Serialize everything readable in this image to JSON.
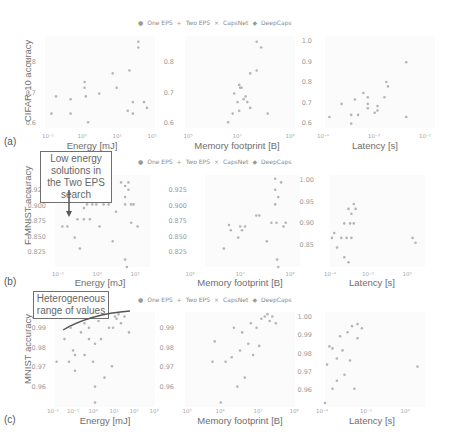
{
  "legend": {
    "entries": [
      {
        "marker": "●",
        "label": "One EPS"
      },
      {
        "marker": "+",
        "label": "Two EPS"
      },
      {
        "marker": "×",
        "label": "CapsNet"
      },
      {
        "marker": "◆",
        "label": "DeepCaps"
      }
    ]
  },
  "rows": [
    {
      "tag": "(a)",
      "ylabel": "CIFAR-10 accuracy",
      "panels": [
        {
          "xlabel": "Energy [mJ]",
          "xticks": [
            "10⁻¹",
            "10⁰",
            "10¹",
            "10²"
          ],
          "yticks": [
            "0.8",
            "0.7",
            "0.6"
          ]
        },
        {
          "xlabel": "Memory footprint [B]",
          "xticks": [
            "10⁵",
            "10⁷",
            "10⁸"
          ],
          "yticks": [
            "0.8",
            "0.7",
            "0.6"
          ]
        },
        {
          "xlabel": "Latency [s]",
          "xticks": [
            "10⁻⁴",
            "10⁻³",
            "10⁻²"
          ],
          "yticks": [
            "1.0",
            "0.9",
            "0.8",
            "0.7",
            "0.6"
          ]
        }
      ]
    },
    {
      "tag": "(b)",
      "ylabel": "F-MNIST accuracy",
      "annotation": "Low energy solutions in the Two EPS search",
      "panels": [
        {
          "xlabel": "Energy [mJ]",
          "xticks": [
            "10⁻¹",
            "10⁰",
            "10¹"
          ],
          "yticks": [
            "0.925",
            "0.900",
            "0.875",
            "0.850",
            "0.825"
          ]
        },
        {
          "xlabel": "Memory footprint [B]",
          "xticks": [
            "10⁶",
            "10⁷",
            "10⁸"
          ],
          "yticks": [
            "0.925",
            "0.900",
            "0.875",
            "0.850",
            "0.825"
          ]
        },
        {
          "xlabel": "Latency [s]",
          "xticks": [
            "10⁻⁴",
            "10⁻²",
            "10⁰"
          ],
          "yticks": [
            "1.00",
            "0.95",
            "0.90",
            "0.85"
          ]
        }
      ]
    },
    {
      "tag": "(c)",
      "ylabel": "MNIST accuracy",
      "annotation": "Heterogeneous range of values",
      "panels": [
        {
          "xlabel": "Energy [mJ]",
          "xticks": [
            "10⁻²",
            "10⁻¹",
            "10⁰",
            "10¹",
            "10²",
            "10³"
          ],
          "yticks": [
            "0.99",
            "0.98",
            "0.97",
            "0.96"
          ]
        },
        {
          "xlabel": "Memory footprint [B]",
          "xticks": [
            "10⁵",
            "10⁶",
            "10⁷",
            "10⁸"
          ],
          "yticks": [
            "0.99",
            "0.98",
            "0.97",
            "0.96"
          ]
        },
        {
          "xlabel": "Latency [s]",
          "xticks": [
            "10⁻⁴",
            "10⁻¹",
            "10⁰"
          ],
          "yticks": [
            "1.00",
            "0.99",
            "0.98",
            "0.97",
            "0.96"
          ]
        }
      ]
    }
  ],
  "chart_data": [
    {
      "type": "scatter",
      "title": "(a) CIFAR-10 accuracy vs Energy",
      "xlabel": "Energy [mJ]",
      "ylabel": "CIFAR-10 accuracy",
      "xscale": "log",
      "xlim": [
        0.1,
        100
      ],
      "ylim": [
        0.58,
        0.9
      ],
      "series": [
        {
          "name": "One EPS/Two EPS/CapsNet/DeepCaps (combined)",
          "x": [
            0.15,
            0.2,
            0.5,
            0.5,
            1.2,
            1.2,
            1.3,
            1.5,
            3,
            7,
            9,
            18,
            20,
            25,
            25,
            35,
            35,
            50,
            60
          ],
          "y": [
            0.63,
            0.69,
            0.63,
            0.68,
            0.72,
            0.74,
            0.69,
            0.6,
            0.7,
            0.77,
            0.72,
            0.64,
            0.78,
            0.63,
            0.67,
            0.88,
            0.86,
            0.67,
            0.65
          ]
        }
      ]
    },
    {
      "type": "scatter",
      "title": "(a) CIFAR-10 accuracy vs Memory",
      "xlabel": "Memory footprint [B]",
      "ylabel": "CIFAR-10 accuracy",
      "xscale": "log",
      "xlim": [
        100000,
        100000000
      ],
      "ylim": [
        0.58,
        0.9
      ],
      "series": [
        {
          "name": "combined",
          "x": [
            1500000.0,
            2000000.0,
            2200000.0,
            2700000.0,
            3000000.0,
            3000000.0,
            3200000.0,
            3500000.0,
            4000000.0,
            4500000.0,
            5000000.0,
            6000000.0,
            6000000.0,
            9000000.0,
            9000000.0,
            12000000.0,
            18000000.0
          ],
          "y": [
            0.6,
            0.63,
            0.7,
            0.67,
            0.73,
            0.64,
            0.72,
            0.72,
            0.68,
            0.69,
            0.67,
            0.77,
            0.65,
            0.88,
            0.78,
            0.86,
            0.63
          ]
        }
      ]
    },
    {
      "type": "scatter",
      "title": "(a) CIFAR-10 accuracy vs Latency",
      "xlabel": "Latency [s]",
      "ylabel": "CIFAR-10 accuracy",
      "xscale": "log",
      "xlim": [
        0.0001,
        0.01
      ],
      "ylim": [
        0.58,
        1.0
      ],
      "series": [
        {
          "name": "combined",
          "x": [
            0.00012,
            0.0002,
            0.0003,
            0.0003,
            0.00035,
            0.0004,
            0.0005,
            0.0006,
            0.0006,
            0.0006,
            0.0008,
            0.0009,
            0.0009,
            0.0012,
            0.0013,
            0.0014,
            0.003,
            0.003
          ],
          "y": [
            0.63,
            0.69,
            0.6,
            0.64,
            0.71,
            0.64,
            0.74,
            0.72,
            0.69,
            0.67,
            0.65,
            0.68,
            0.66,
            0.72,
            0.79,
            0.77,
            0.88,
            0.63
          ]
        }
      ]
    },
    {
      "type": "scatter",
      "title": "(b) F-MNIST accuracy vs Energy",
      "xlabel": "Energy [mJ]",
      "ylabel": "F-MNIST accuracy",
      "xscale": "log",
      "xlim": [
        0.1,
        20
      ],
      "ylim": [
        0.815,
        0.94
      ],
      "series": [
        {
          "name": "combined",
          "x": [
            0.15,
            0.2,
            0.3,
            0.35,
            0.4,
            0.5,
            0.5,
            0.6,
            0.7,
            0.8,
            1,
            1.2,
            1.5,
            2,
            2.5,
            3,
            4,
            5,
            5,
            5,
            5,
            5.5,
            6,
            6,
            7,
            7,
            8,
            10
          ],
          "y": [
            0.87,
            0.87,
            0.855,
            0.88,
            0.84,
            0.88,
            0.895,
            0.9,
            0.88,
            0.9,
            0.9,
            0.87,
            0.9,
            0.9,
            0.85,
            0.89,
            0.93,
            0.925,
            0.91,
            0.9,
            0.825,
            0.815,
            0.93,
            0.92,
            0.875,
            0.9,
            0.9,
            0.87
          ]
        }
      ]
    },
    {
      "type": "scatter",
      "title": "(b) F-MNIST accuracy vs Memory",
      "xlabel": "Memory footprint [B]",
      "ylabel": "F-MNIST accuracy",
      "xscale": "log",
      "xlim": [
        1000000,
        100000000
      ],
      "ylim": [
        0.815,
        0.94
      ],
      "series": [
        {
          "name": "combined",
          "x": [
            2500000.0,
            3200000.0,
            3500000.0,
            5000000.0,
            5500000.0,
            6000000.0,
            7000000.0,
            12000000.0,
            14000000.0,
            20000000.0,
            25000000.0,
            30000000.0,
            30000000.0,
            30000000.0,
            32000000.0,
            33000000.0,
            35000000.0,
            35000000.0,
            40000000.0,
            45000000.0,
            50000000.0
          ],
          "y": [
            0.84,
            0.872,
            0.865,
            0.855,
            0.87,
            0.865,
            0.87,
            0.885,
            0.885,
            0.85,
            0.875,
            0.935,
            0.92,
            0.9,
            0.875,
            0.825,
            0.91,
            0.815,
            0.93,
            0.87,
            0.875
          ]
        }
      ]
    },
    {
      "type": "scatter",
      "title": "(b) F-MNIST accuracy vs Latency",
      "xlabel": "Latency [s]",
      "ylabel": "F-MNIST accuracy",
      "xscale": "log",
      "xlim": [
        0.0001,
        1
      ],
      "ylim": [
        0.81,
        1.0
      ],
      "series": [
        {
          "name": "combined",
          "x": [
            0.00012,
            0.00015,
            0.0002,
            0.0003,
            0.0004,
            0.0004,
            0.0005,
            0.0006,
            0.0006,
            0.0007,
            0.0008,
            0.0008,
            0.001,
            0.001,
            0.0012,
            0.3,
            0.4
          ],
          "y": [
            0.87,
            0.88,
            0.85,
            0.87,
            0.83,
            0.9,
            0.87,
            0.82,
            0.93,
            0.9,
            0.87,
            0.92,
            0.94,
            0.9,
            0.93,
            0.87,
            0.86
          ]
        }
      ]
    },
    {
      "type": "scatter",
      "title": "(c) MNIST accuracy vs Energy",
      "xlabel": "Energy [mJ]",
      "ylabel": "MNIST accuracy",
      "xscale": "log",
      "xlim": [
        0.01,
        1000
      ],
      "ylim": [
        0.955,
        0.997
      ],
      "series": [
        {
          "name": "combined",
          "x": [
            0.012,
            0.03,
            0.05,
            0.06,
            0.08,
            0.1,
            0.1,
            0.2,
            0.3,
            0.3,
            0.5,
            0.5,
            0.8,
            1,
            1,
            1,
            1.5,
            2,
            3,
            5,
            7,
            8,
            10,
            12,
            15,
            20,
            30,
            50
          ],
          "y": [
            0.975,
            0.985,
            0.975,
            0.99,
            0.98,
            0.978,
            0.971,
            0.988,
            0.992,
            0.978,
            0.99,
            0.985,
            0.975,
            0.983,
            0.964,
            0.957,
            0.993,
            0.985,
            0.968,
            0.99,
            0.973,
            0.99,
            0.995,
            0.994,
            0.996,
            0.992,
            0.995,
            0.988
          ]
        }
      ]
    },
    {
      "type": "scatter",
      "title": "(c) MNIST accuracy vs Memory",
      "xlabel": "Memory footprint [B]",
      "ylabel": "MNIST accuracy",
      "xscale": "log",
      "xlim": [
        10000,
        100000000
      ],
      "ylim": [
        0.955,
        0.997
      ],
      "series": [
        {
          "name": "combined",
          "x": [
            100000,
            120000,
            200000,
            300000,
            500000,
            600000,
            800000,
            1000000,
            1200000,
            1500000,
            2000000,
            2500000,
            3000000,
            4000000,
            5000000,
            6000000,
            8000000,
            10000000,
            12000000,
            15000000,
            20000000
          ],
          "y": [
            0.975,
            0.984,
            0.957,
            0.975,
            0.977,
            0.99,
            0.964,
            0.98,
            0.988,
            0.968,
            0.983,
            0.992,
            0.978,
            0.99,
            0.982,
            0.994,
            0.995,
            0.996,
            0.993,
            0.995,
            0.992
          ]
        }
      ]
    },
    {
      "type": "scatter",
      "title": "(c) MNIST accuracy vs Latency",
      "xlabel": "Latency [s]",
      "ylabel": "MNIST accuracy",
      "xscale": "log",
      "xlim": [
        0.0001,
        1
      ],
      "ylim": [
        0.955,
        1.002
      ],
      "series": [
        {
          "name": "combined",
          "x": [
            0.0001,
            0.00012,
            0.00015,
            0.0002,
            0.0002,
            0.0003,
            0.0003,
            0.0004,
            0.0005,
            0.0006,
            0.0008,
            0.001,
            0.0012,
            0.0015,
            0.002,
            0.002,
            0.003,
            0.5
          ],
          "y": [
            0.957,
            0.976,
            0.985,
            0.964,
            0.984,
            0.968,
            0.979,
            0.99,
            0.983,
            0.971,
            0.992,
            0.978,
            0.995,
            0.964,
            0.996,
            0.989,
            0.994,
            0.975
          ]
        }
      ]
    }
  ]
}
